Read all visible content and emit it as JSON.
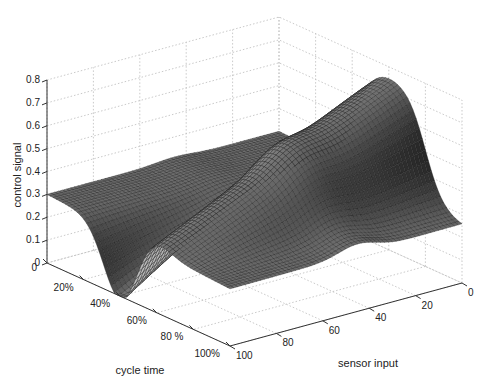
{
  "chart_data": {
    "type": "surface3d",
    "title": "",
    "xlabel": "cycle time",
    "ylabel": "sensor input",
    "zlabel": "control signal",
    "x_ticks": [
      "0",
      "20%",
      "40%",
      "60%",
      "80 %",
      "100%"
    ],
    "x_tick_values": [
      0,
      20,
      40,
      60,
      80,
      100
    ],
    "y_ticks": [
      "0",
      "20",
      "40",
      "60",
      "80",
      "100"
    ],
    "y_tick_values": [
      0,
      20,
      40,
      60,
      80,
      100
    ],
    "z_ticks": [
      "0",
      "0.1",
      "0.2",
      "0.3",
      "0.4",
      "0.5",
      "0.6",
      "0.7",
      "0.8"
    ],
    "z_tick_values": [
      0,
      0.1,
      0.2,
      0.3,
      0.4,
      0.5,
      0.6,
      0.7,
      0.8
    ],
    "xlim": [
      0,
      100
    ],
    "ylim": [
      0,
      100
    ],
    "zlim": [
      0,
      0.8
    ],
    "grid": true,
    "colormap": "gray",
    "samples": {
      "cycle_time": [
        0,
        20,
        40,
        50,
        60,
        80,
        100
      ],
      "sensor_input_0": [
        0.3,
        0.35,
        0.55,
        0.75,
        0.78,
        0.55,
        0.24
      ],
      "sensor_input_50": [
        0.3,
        0.3,
        0.3,
        0.45,
        0.5,
        0.4,
        0.26
      ],
      "sensor_input_100": [
        0.3,
        0.2,
        0.02,
        0.25,
        0.32,
        0.3,
        0.28
      ]
    }
  },
  "axes": {
    "corner_zero_label": "0"
  }
}
